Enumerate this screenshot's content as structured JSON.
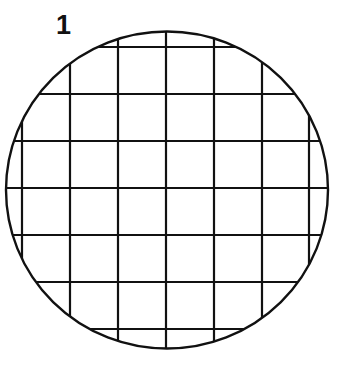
{
  "figure": {
    "label": "1",
    "colors": {
      "stroke": "#111111",
      "background": "#ffffff"
    },
    "circle": {
      "cx": 167,
      "cy": 190,
      "rx": 161,
      "ry": 158.5,
      "stroke_width": 2.4
    },
    "grid": {
      "vertical_lines_x": [
        22,
        70,
        118,
        166,
        214,
        262,
        309
      ],
      "horizontal_lines_y": [
        47,
        94,
        141,
        188,
        235,
        282,
        329
      ],
      "stroke_width": 2.2
    }
  }
}
